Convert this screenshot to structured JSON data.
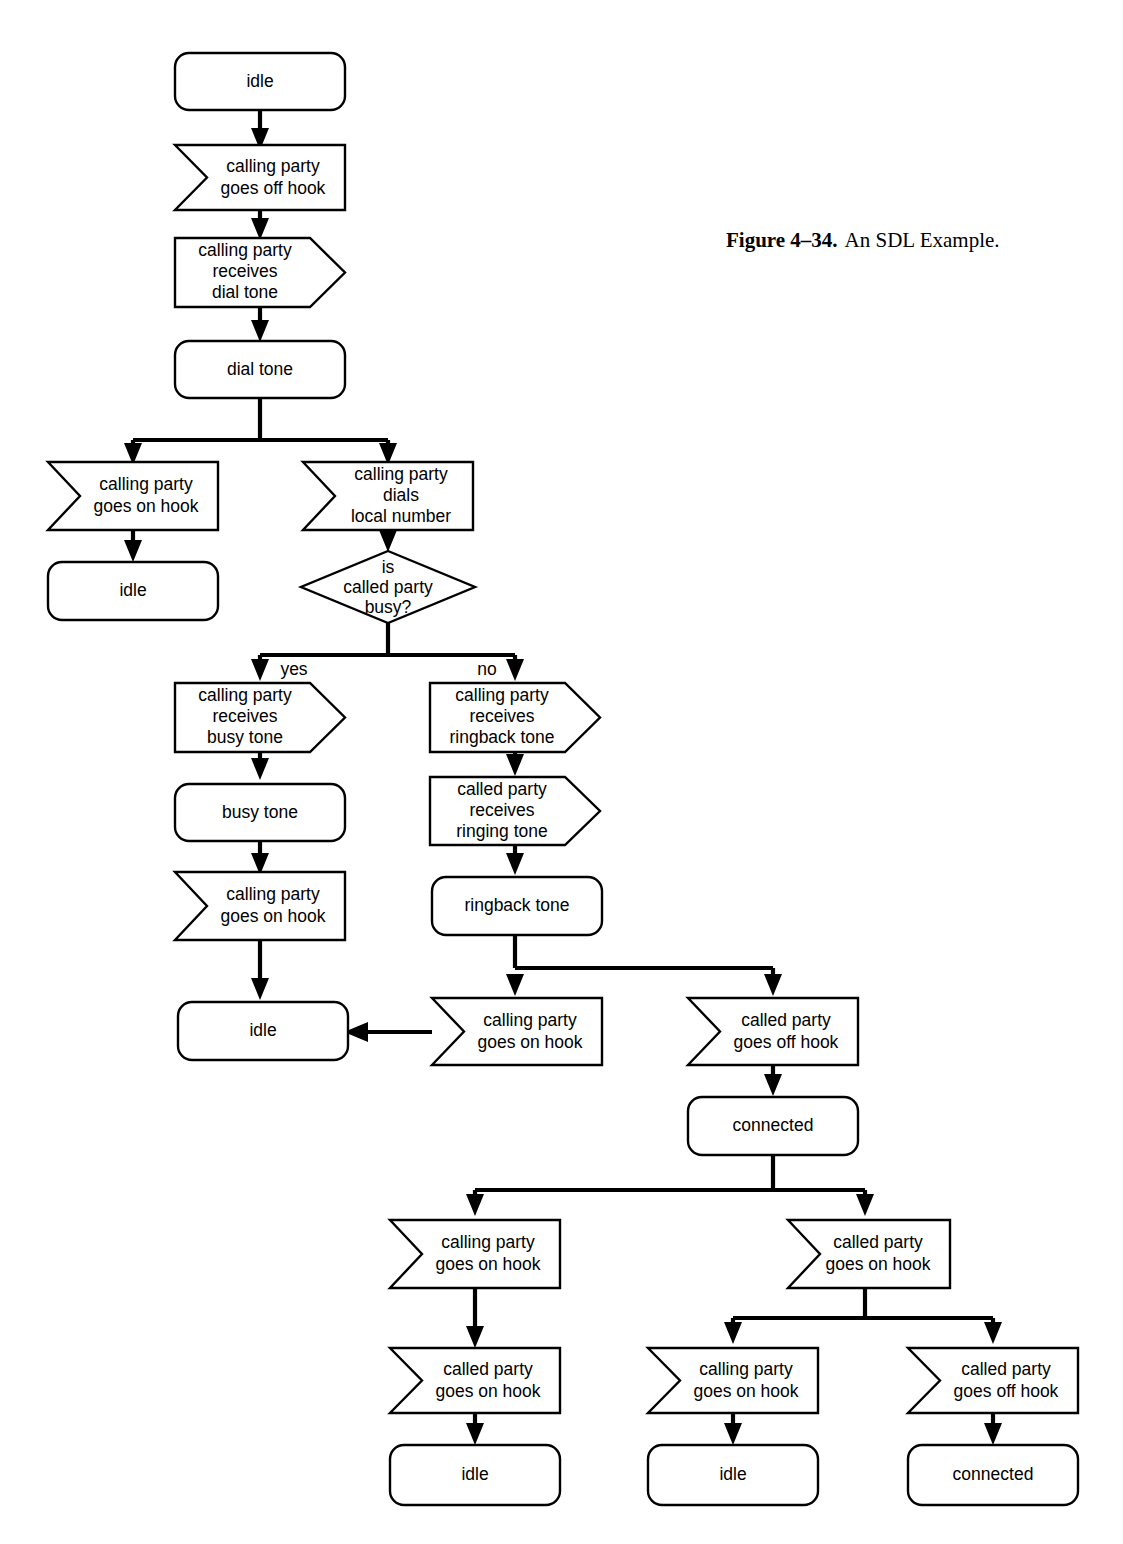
{
  "figure": {
    "label": "Figure 4–34.",
    "title": "An SDL Example."
  },
  "diagram": {
    "type": "sdl-state-flow",
    "shape_kinds": {
      "state": "rounded-rectangle",
      "input": "left-notched-rectangle",
      "output": "right-pointed-rectangle",
      "decision": "diamond"
    },
    "nodes": [
      {
        "id": "n1",
        "kind": "state",
        "lines": [
          "idle"
        ]
      },
      {
        "id": "n2",
        "kind": "input",
        "lines": [
          "calling party",
          "goes off hook"
        ]
      },
      {
        "id": "n3",
        "kind": "output",
        "lines": [
          "calling party",
          "receives",
          "dial tone"
        ]
      },
      {
        "id": "n4",
        "kind": "state",
        "lines": [
          "dial tone"
        ]
      },
      {
        "id": "n5",
        "kind": "input",
        "lines": [
          "calling party",
          "goes on hook"
        ]
      },
      {
        "id": "n6",
        "kind": "state",
        "lines": [
          "idle"
        ]
      },
      {
        "id": "n7",
        "kind": "input",
        "lines": [
          "calling party",
          "dials",
          "local number"
        ]
      },
      {
        "id": "n8",
        "kind": "decision",
        "lines": [
          "is",
          "called party",
          "busy?"
        ]
      },
      {
        "id": "n9",
        "kind": "output",
        "lines": [
          "calling party",
          "receives",
          "busy tone"
        ]
      },
      {
        "id": "n10",
        "kind": "state",
        "lines": [
          "busy tone"
        ]
      },
      {
        "id": "n11",
        "kind": "input",
        "lines": [
          "calling party",
          "goes on hook"
        ]
      },
      {
        "id": "n12",
        "kind": "state",
        "lines": [
          "idle"
        ]
      },
      {
        "id": "n13",
        "kind": "output",
        "lines": [
          "calling party",
          "receives",
          "ringback tone"
        ]
      },
      {
        "id": "n14",
        "kind": "output",
        "lines": [
          "called party",
          "receives",
          "ringing tone"
        ]
      },
      {
        "id": "n15",
        "kind": "state",
        "lines": [
          "ringback tone"
        ]
      },
      {
        "id": "n16",
        "kind": "input",
        "lines": [
          "calling party",
          "goes on hook"
        ]
      },
      {
        "id": "n17",
        "kind": "input",
        "lines": [
          "called party",
          "goes off hook"
        ]
      },
      {
        "id": "n18",
        "kind": "state",
        "lines": [
          "connected"
        ]
      },
      {
        "id": "n19",
        "kind": "input",
        "lines": [
          "calling party",
          "goes on hook"
        ]
      },
      {
        "id": "n20",
        "kind": "input",
        "lines": [
          "called party",
          "goes on hook"
        ]
      },
      {
        "id": "n21",
        "kind": "input",
        "lines": [
          "called party",
          "goes on hook"
        ]
      },
      {
        "id": "n22",
        "kind": "state",
        "lines": [
          "idle"
        ]
      },
      {
        "id": "n23",
        "kind": "input",
        "lines": [
          "calling party",
          "goes on hook"
        ]
      },
      {
        "id": "n24",
        "kind": "state",
        "lines": [
          "idle"
        ]
      },
      {
        "id": "n25",
        "kind": "input",
        "lines": [
          "called party",
          "goes off hook"
        ]
      },
      {
        "id": "n26",
        "kind": "state",
        "lines": [
          "connected"
        ]
      }
    ],
    "branch_labels": [
      {
        "id": "yes-label",
        "text": "yes"
      },
      {
        "id": "no-label",
        "text": "no"
      }
    ],
    "colors": {
      "stroke": "#000000",
      "fill": "#ffffff",
      "background": "#ffffff"
    }
  }
}
